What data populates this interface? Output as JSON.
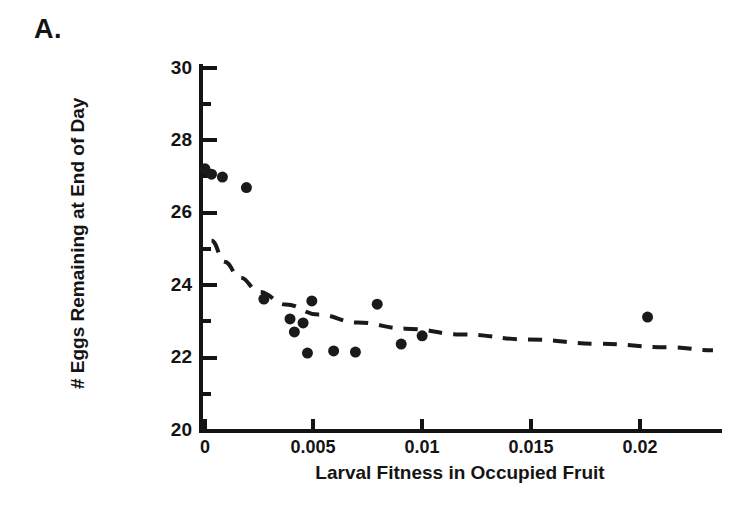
{
  "panel": {
    "label": "A."
  },
  "chart_data": {
    "type": "scatter",
    "title": "",
    "xlabel": "Larval Fitness in Occupied Fruit",
    "ylabel": "# Eggs Remaining at End of Day",
    "xlim": [
      0,
      0.0235
    ],
    "ylim": [
      20,
      30
    ],
    "xticks": [
      0,
      0.005,
      0.01,
      0.015,
      0.02
    ],
    "xticklabels": [
      "0",
      "0.005",
      "0.01",
      "0.015",
      "0.02"
    ],
    "yticks": [
      20,
      22,
      24,
      26,
      28,
      30
    ],
    "yticklabels": [
      "20",
      "22",
      "24",
      "26",
      "28",
      "30"
    ],
    "y_minor_ticks": [
      21,
      23,
      25,
      27,
      29
    ],
    "grid": false,
    "legend": null,
    "marker": "filled-circle",
    "marker_color": "#1a1a1a",
    "marker_size_px": 11,
    "points": [
      {
        "x": 0.0,
        "y": 27.2
      },
      {
        "x": 0.0003,
        "y": 27.05
      },
      {
        "x": 0.0008,
        "y": 26.97
      },
      {
        "x": 0.0019,
        "y": 26.68
      },
      {
        "x": 0.0027,
        "y": 23.58
      },
      {
        "x": 0.0039,
        "y": 23.03
      },
      {
        "x": 0.0041,
        "y": 22.67
      },
      {
        "x": 0.0045,
        "y": 22.92
      },
      {
        "x": 0.0047,
        "y": 22.08
      },
      {
        "x": 0.0049,
        "y": 23.53
      },
      {
        "x": 0.0059,
        "y": 22.14
      },
      {
        "x": 0.0069,
        "y": 22.11
      },
      {
        "x": 0.0079,
        "y": 23.44
      },
      {
        "x": 0.009,
        "y": 22.33
      },
      {
        "x": 0.00996,
        "y": 22.56
      },
      {
        "x": 0.0203,
        "y": 23.08
      }
    ],
    "fit_curve": {
      "style": "dashed",
      "color": "#1a1a1a",
      "width_px": 4,
      "dash_pattern": "14 11",
      "description": "decreasing power/decay fit through scatter",
      "points": [
        {
          "x": 0.0003,
          "y": 25.2
        },
        {
          "x": 0.0009,
          "y": 24.62
        },
        {
          "x": 0.0016,
          "y": 24.18
        },
        {
          "x": 0.0025,
          "y": 23.78
        },
        {
          "x": 0.0037,
          "y": 23.43
        },
        {
          "x": 0.0052,
          "y": 23.15
        },
        {
          "x": 0.007,
          "y": 22.93
        },
        {
          "x": 0.0092,
          "y": 22.76
        },
        {
          "x": 0.0118,
          "y": 22.6
        },
        {
          "x": 0.0148,
          "y": 22.46
        },
        {
          "x": 0.018,
          "y": 22.34
        },
        {
          "x": 0.0213,
          "y": 22.24
        },
        {
          "x": 0.0233,
          "y": 22.16
        }
      ]
    }
  }
}
